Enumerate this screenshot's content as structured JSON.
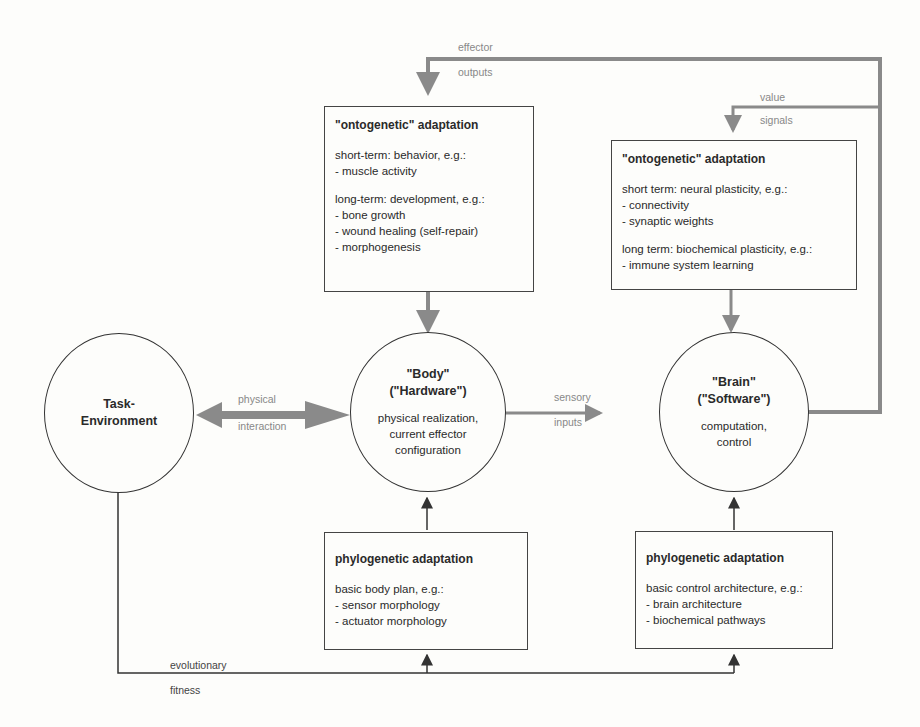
{
  "nodes": {
    "task_env": {
      "title_line1": "Task-",
      "title_line2": "Environment"
    },
    "body": {
      "title_line1": "\"Body\"",
      "title_line2": "(\"Hardware\")",
      "desc_line1": "physical realization,",
      "desc_line2": "current effector",
      "desc_line3": "configuration"
    },
    "brain": {
      "title_line1": "\"Brain\"",
      "title_line2": "(\"Software\")",
      "desc_line1": "computation,",
      "desc_line2": "control"
    }
  },
  "boxes": {
    "body_onto": {
      "title": "\"ontogenetic\" adaptation",
      "short_heading": "short-term: behavior, e.g.:",
      "short_items": [
        "- muscle activity"
      ],
      "long_heading": "long-term: development, e.g.:",
      "long_items": [
        "- bone growth",
        "- wound healing (self-repair)",
        "- morphogenesis"
      ]
    },
    "brain_onto": {
      "title": "\"ontogenetic\" adaptation",
      "short_heading": "short term: neural plasticity, e.g.:",
      "short_items": [
        "- connectivity",
        "- synaptic weights"
      ],
      "long_heading": "long term: biochemical plasticity, e.g.:",
      "long_items": [
        "- immune system learning"
      ]
    },
    "body_phylo": {
      "title": "phylogenetic adaptation",
      "heading": "basic body plan, e.g.:",
      "items": [
        "- sensor morphology",
        "- actuator morphology"
      ]
    },
    "brain_phylo": {
      "title": "phylogenetic adaptation",
      "heading": "basic control architecture, e.g.:",
      "items": [
        "- brain architecture",
        "- biochemical pathways"
      ]
    }
  },
  "edges": {
    "effector": {
      "line1": "effector",
      "line2": "outputs"
    },
    "value": {
      "line1": "value",
      "line2": "signals"
    },
    "physical": {
      "line1": "physical",
      "line2": "interaction"
    },
    "sensory": {
      "line1": "sensory",
      "line2": "inputs"
    },
    "fitness": {
      "line1": "evolutionary",
      "line2": "fitness"
    }
  },
  "colors": {
    "gray_arrow": "#8a8a8a",
    "dark_line": "#333333"
  }
}
